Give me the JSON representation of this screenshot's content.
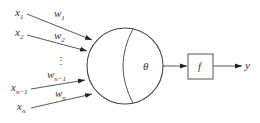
{
  "diagram": {
    "title": "",
    "inputs": [
      {
        "var": "x",
        "sub": "1",
        "weight": "w",
        "weight_sub": "1"
      },
      {
        "var": "x",
        "sub": "2",
        "weight": "w",
        "weight_sub": "2"
      },
      {
        "var": "x",
        "sub": "n−1",
        "weight": "w",
        "weight_sub": "n−1"
      },
      {
        "var": "x",
        "sub": "n",
        "weight": "w",
        "weight_sub": "n"
      }
    ],
    "ellipsis": "⋮",
    "neuron": {
      "threshold_label": "θ"
    },
    "activation": {
      "label": "f"
    },
    "output": {
      "label": "y"
    },
    "colors": {
      "stroke": "#444444",
      "text": "#333333",
      "background": "#ffffff"
    }
  }
}
